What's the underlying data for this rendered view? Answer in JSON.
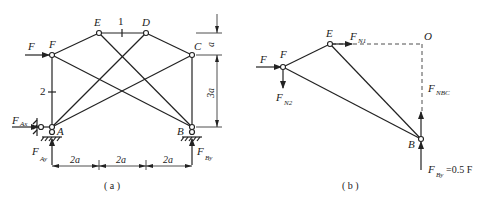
{
  "panel_a": {
    "caption": "( a )",
    "nodes": {
      "A": "A",
      "B": "B",
      "C": "C",
      "D": "D",
      "E": "E",
      "F": "F"
    },
    "member_labels": {
      "m1": "1",
      "m2": "2"
    },
    "loads": {
      "F": "F",
      "FAx": "F",
      "FAx_sub": "Ax",
      "FAy": "F",
      "FAy_sub": "Ay",
      "FBy": "F",
      "FBy_sub": "By"
    },
    "dims": {
      "h1": "2a",
      "h2": "2a",
      "h3": "2a",
      "v1": "a",
      "v2": "3a"
    }
  },
  "panel_b": {
    "caption": "( b )",
    "nodes": {
      "F": "F",
      "E": "E",
      "O": "O",
      "B": "B"
    },
    "loads": {
      "F": "F",
      "FN1": "F",
      "FN1_sub": "N1",
      "FN2": "F",
      "FN2_sub": "N2",
      "FNBC": "F",
      "FNBC_sub": "NBC",
      "FBy": "F",
      "FBy_sub": "By",
      "FBy_val": "=0.5 F"
    }
  }
}
